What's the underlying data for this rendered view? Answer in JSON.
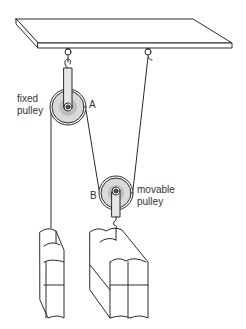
{
  "diagram": {
    "labels": {
      "fixed_line1": "fixed",
      "fixed_line2": "pulley",
      "point_a": "A",
      "point_b": "B",
      "movable_line1": "movable",
      "movable_line2": "pulley"
    },
    "colors": {
      "line": "#2a2a2a",
      "pulley_fill": "#d9d9d9",
      "pulley_inner": "#bdbdbd",
      "background": "#ffffff"
    },
    "components": [
      {
        "name": "ceiling-beam"
      },
      {
        "name": "fixed-pulley"
      },
      {
        "name": "movable-pulley"
      },
      {
        "name": "left-book-load"
      },
      {
        "name": "right-book-load"
      }
    ]
  }
}
